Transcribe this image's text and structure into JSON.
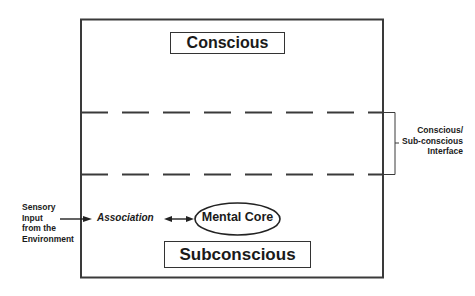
{
  "diagram": {
    "regions": {
      "conscious": "Conscious",
      "subconscious": "Subconscious"
    },
    "interface_label": [
      "Conscious/",
      "Sub-conscious",
      "Interface"
    ],
    "input_label": [
      "Sensory",
      "Input",
      "from the",
      "Environment"
    ],
    "association_label": "Association",
    "core_label": "Mental Core",
    "colors": {
      "line": "#333333",
      "background": "#ffffff"
    }
  }
}
